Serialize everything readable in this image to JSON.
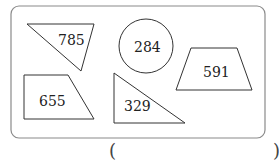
{
  "figure": {
    "frame": {
      "stroke": "#8a8a8a",
      "fill": "#ffffff"
    },
    "shapes": [
      {
        "type": "triangle",
        "label": "785"
      },
      {
        "type": "circle",
        "label": "284"
      },
      {
        "type": "trapezoid",
        "label": "591"
      },
      {
        "type": "quadrilateral",
        "label": "655"
      },
      {
        "type": "right-triangle",
        "label": "329"
      }
    ]
  },
  "answer": {
    "open_paren": "(",
    "close_paren": ")",
    "value": ""
  }
}
